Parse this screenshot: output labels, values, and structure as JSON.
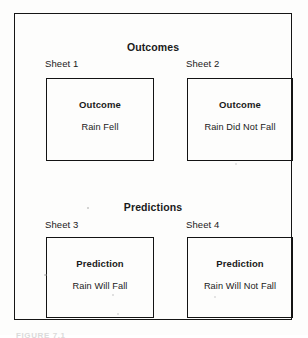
{
  "figure": {
    "caption": "FIGURE 7.1",
    "border_color": "#151515",
    "background_color": "#fdfdfc"
  },
  "sections": [
    {
      "title": "Outcomes",
      "sheets": [
        {
          "label": "Sheet 1",
          "heading": "Outcome",
          "body": "Rain Fell"
        },
        {
          "label": "Sheet 2",
          "heading": "Outcome",
          "body": "Rain Did Not Fall"
        }
      ]
    },
    {
      "title": "Predictions",
      "sheets": [
        {
          "label": "Sheet 3",
          "heading": "Prediction",
          "body": "Rain Will Fall"
        },
        {
          "label": "Sheet 4",
          "heading": "Prediction",
          "body": "Rain Will Not Fall"
        }
      ]
    }
  ]
}
